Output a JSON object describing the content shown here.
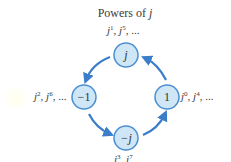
{
  "title": {
    "prefix": "Powers of ",
    "variable": "j"
  },
  "colors": {
    "node_fill": "#cfe6f7",
    "node_stroke": "#4a8fd0",
    "arrow": "#3a7dc9",
    "text": "#333333"
  },
  "nodes": [
    {
      "id": "top",
      "value": "j",
      "label": {
        "base1": "j",
        "exp1": "1",
        "base2": "j",
        "exp2": "5",
        "tail": ", ..."
      }
    },
    {
      "id": "left",
      "value": "−1",
      "label": {
        "base1": "j",
        "exp1": "2",
        "base2": "j",
        "exp2": "6",
        "tail": ", ..."
      }
    },
    {
      "id": "right",
      "value": "1",
      "label": {
        "base1": "j",
        "exp1": "0",
        "base2": "j",
        "exp2": "4",
        "tail": ", ..."
      }
    },
    {
      "id": "bottom",
      "value": "−j",
      "label": {
        "base1": "j",
        "exp1": "3",
        "base2": "j",
        "exp2": "7",
        "tail": ""
      }
    }
  ],
  "arrows": [
    {
      "from": "top",
      "to": "left"
    },
    {
      "from": "left",
      "to": "bottom"
    },
    {
      "from": "bottom",
      "to": "right"
    },
    {
      "from": "right",
      "to": "top"
    }
  ]
}
